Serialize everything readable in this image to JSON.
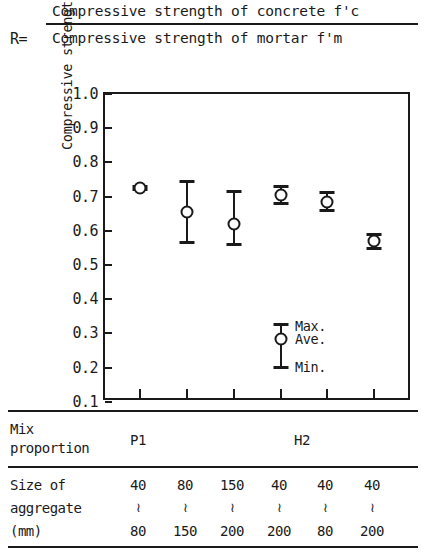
{
  "formula": {
    "r_label": "R=",
    "numerator": "Compressive strength of concrete f'c",
    "denominator": "Compressive strength of mortar   f'm"
  },
  "chart_data": {
    "type": "scatter",
    "title": "",
    "xlabel": "",
    "ylabel": "Compressive strength ratio R",
    "ylim": [
      0.0,
      1.0
    ],
    "ytick_labels": [
      "1.0",
      "0.9",
      "0.8",
      "0.7",
      "0.6",
      "0.5",
      "0.4",
      "0.3",
      "0.2",
      "0.1"
    ],
    "ytick_values": [
      1.0,
      0.9,
      0.8,
      0.7,
      0.6,
      0.5,
      0.4,
      0.3,
      0.2,
      0.1
    ],
    "grid": false,
    "legend_position": "inside-center",
    "legend": [
      {
        "key": "max",
        "label": "Max."
      },
      {
        "key": "ave",
        "label": "Ave."
      },
      {
        "key": "min",
        "label": "Min."
      }
    ],
    "categories": [
      "40~80",
      "80~150",
      "150~200",
      "40~200",
      "40~80",
      "40~200"
    ],
    "mix_proportions": [
      "P1",
      "P1",
      "P1",
      "H2",
      "H2",
      "H2"
    ],
    "series": [
      {
        "name": "Compressive strength ratio R",
        "ave": [
          0.725,
          0.655,
          0.62,
          0.705,
          0.685,
          0.57
        ],
        "max": [
          0.735,
          0.75,
          0.72,
          0.735,
          0.715,
          0.595
        ],
        "min": [
          0.715,
          0.56,
          0.555,
          0.675,
          0.655,
          0.545
        ]
      }
    ]
  },
  "table": {
    "mix_row": {
      "header_line1": "Mix",
      "header_line2": "proportion",
      "groups": [
        {
          "label": "P1"
        },
        {
          "label": "H2"
        }
      ]
    },
    "size_row": {
      "header_line1": "Size of",
      "header_line2": "aggregate",
      "header_line3": "(mm)",
      "separator": "≀",
      "columns": [
        {
          "from": "40",
          "to": "80"
        },
        {
          "from": "80",
          "to": "150"
        },
        {
          "from": "150",
          "to": "200"
        },
        {
          "from": "40",
          "to": "200"
        },
        {
          "from": "40",
          "to": "80"
        },
        {
          "from": "40",
          "to": "200"
        }
      ]
    }
  },
  "colors": {
    "ink": "#1a1a1a",
    "paper": "#ffffff"
  }
}
